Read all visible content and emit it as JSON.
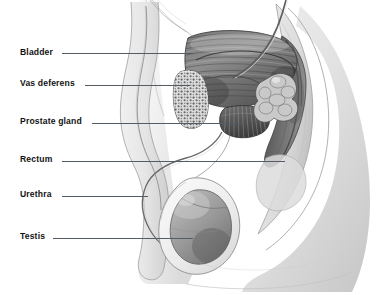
{
  "diagram": {
    "type": "anatomical-illustration",
    "style": "grayscale pencil / airbrush medical illustration",
    "background_color": "#ffffff",
    "leader_line_color": "#555c64",
    "label_text_color": "#131313",
    "labels": [
      {
        "id": "bladder",
        "text": "Bladder",
        "x": 20,
        "y": 48,
        "leader": {
          "x1": 62,
          "x2": 193,
          "y": 53
        }
      },
      {
        "id": "vas-deferens",
        "text": "Vas deferens",
        "x": 20,
        "y": 79,
        "leader": {
          "x1": 85,
          "x2": 190,
          "y": 85
        }
      },
      {
        "id": "prostate-gland",
        "text": "Prostate gland",
        "x": 20,
        "y": 117,
        "leader": {
          "x1": 92,
          "x2": 245,
          "y": 123
        }
      },
      {
        "id": "rectum",
        "text": "Rectum",
        "x": 20,
        "y": 155,
        "leader": {
          "x1": 62,
          "x2": 285,
          "y": 161
        }
      },
      {
        "id": "urethra",
        "text": "Urethra",
        "x": 20,
        "y": 190,
        "leader": {
          "x1": 62,
          "x2": 148,
          "y": 196
        }
      },
      {
        "id": "testis",
        "text": "Testis",
        "x": 20,
        "y": 232,
        "leader": {
          "x1": 53,
          "x2": 193,
          "y": 238
        }
      }
    ],
    "structures": [
      {
        "id": "bladder",
        "label": "Bladder",
        "description": "large striated dome-shaped muscular organ, upper center"
      },
      {
        "id": "vas-deferens",
        "label": "Vas deferens",
        "description": "duct passing over pubic bone toward prostate"
      },
      {
        "id": "prostate-gland",
        "label": "Prostate gland",
        "description": "striated gland beneath the bladder"
      },
      {
        "id": "rectum",
        "label": "Rectum",
        "description": "dark curved passage at right, anterior to sacrum"
      },
      {
        "id": "urethra",
        "label": "Urethra",
        "description": "narrow tube descending through the penis"
      },
      {
        "id": "testis",
        "label": "Testis",
        "description": "oval gray mass within the scrotum"
      },
      {
        "id": "pubic-bone",
        "label": "Pubic bone",
        "description": "porous trabecular bone cross-section"
      },
      {
        "id": "seminal-vesicle",
        "label": "Seminal vesicle",
        "description": "lobulated cluster posterior to bladder"
      },
      {
        "id": "sacrum",
        "label": "Sacrum",
        "description": "curved pale bone at right forming posterior wall"
      }
    ]
  }
}
